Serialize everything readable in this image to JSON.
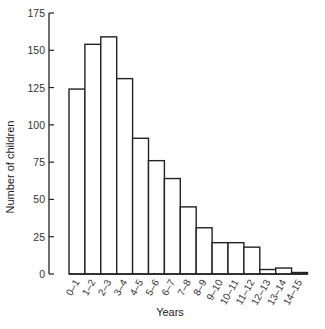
{
  "chart_data": {
    "type": "bar",
    "title": "",
    "xlabel": "Years",
    "ylabel": "Number of children",
    "ylim": [
      0,
      175
    ],
    "yticks": [
      0,
      25,
      50,
      75,
      100,
      125,
      150,
      175
    ],
    "grid": false,
    "legend": null,
    "categories": [
      "0–1",
      "1–2",
      "2–3",
      "3–4",
      "4–5",
      "5–6",
      "6–7",
      "7–8",
      "8–9",
      "9–10",
      "10–11",
      "11–12",
      "12–13",
      "13–14",
      "14–15"
    ],
    "values": [
      124,
      154,
      159,
      131,
      91,
      76,
      64,
      45,
      31,
      21,
      21,
      18,
      3,
      4,
      1
    ],
    "style": {
      "bar_fill": "#ffffff",
      "bar_stroke": "#222222",
      "axis_color": "#222222"
    }
  },
  "labels": {
    "xlabel": "Years",
    "ylabel": "Number of children"
  }
}
